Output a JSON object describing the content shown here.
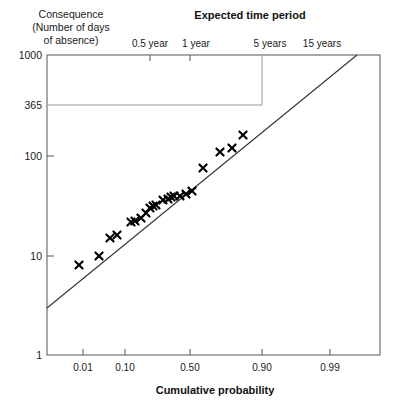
{
  "chart_data": {
    "type": "scatter",
    "title": "Expected time period",
    "xlabel": "Cumulative probability",
    "ylabel": "Consequence (Number of days of absence)",
    "ylabel_lines": [
      "Consequence",
      "(Number of days",
      "of absence)"
    ],
    "x_axis": {
      "scale": "normal-probability",
      "tick_labels": [
        "0.01",
        "0.10",
        "0.50",
        "0.90",
        "0.99"
      ],
      "tick_values": [
        0.01,
        0.1,
        0.5,
        0.9,
        0.99
      ],
      "tick_px": [
        83,
        125,
        190,
        262,
        330
      ],
      "range_px": [
        47,
        380
      ]
    },
    "y_axis": {
      "scale": "log10",
      "tick_labels": [
        "1000",
        "365",
        "100",
        "10",
        "1"
      ],
      "tick_values": [
        1000,
        365,
        100,
        10,
        1
      ],
      "tick_px": [
        55,
        105,
        156,
        256,
        355
      ],
      "ylim": [
        1,
        1000
      ],
      "range_px": [
        355,
        55
      ]
    },
    "top_axis": {
      "label": "Expected time period",
      "tick_labels": [
        "0.5 year",
        "1 year",
        "5 years",
        "15 years"
      ],
      "tick_px": [
        150,
        190,
        262,
        310
      ],
      "label_px": [
        150,
        196,
        270,
        322
      ]
    },
    "grid": false,
    "legend": null,
    "reference_lines": [
      {
        "name": "consequence-365-horizontal",
        "orientation": "horizontal",
        "value": 365,
        "from_px": [
          47,
          105
        ],
        "to_px": [
          262,
          105
        ]
      },
      {
        "name": "five-year-vertical",
        "orientation": "vertical",
        "value": "5 years",
        "from_px": [
          262,
          105
        ],
        "to_px": [
          262,
          55
        ]
      }
    ],
    "fit_line": {
      "name": "lognormal-fit-line",
      "from_px": [
        47,
        308
      ],
      "to_px": [
        357,
        55
      ]
    },
    "marker": "x",
    "points_px": [
      [
        79,
        265
      ],
      [
        99,
        256
      ],
      [
        110,
        238
      ],
      [
        117,
        235
      ],
      [
        131,
        222
      ],
      [
        135,
        221
      ],
      [
        141,
        218
      ],
      [
        146,
        213
      ],
      [
        150,
        208
      ],
      [
        153,
        206
      ],
      [
        156,
        205
      ],
      [
        163,
        200
      ],
      [
        168,
        199
      ],
      [
        171,
        197
      ],
      [
        174,
        196
      ],
      [
        180,
        196
      ],
      [
        186,
        194
      ],
      [
        192,
        191
      ],
      [
        203,
        168
      ],
      [
        220,
        152
      ],
      [
        232,
        148
      ],
      [
        243,
        135
      ]
    ],
    "points_data": [
      {
        "p": 0.02,
        "days": 9
      },
      {
        "p": 0.08,
        "days": 10.5
      },
      {
        "p": 0.12,
        "days": 14
      },
      {
        "p": 0.14,
        "days": 15
      },
      {
        "p": 0.22,
        "days": 19
      },
      {
        "p": 0.24,
        "days": 19.5
      },
      {
        "p": 0.27,
        "days": 21
      },
      {
        "p": 0.3,
        "days": 23
      },
      {
        "p": 0.33,
        "days": 25
      },
      {
        "p": 0.35,
        "days": 26
      },
      {
        "p": 0.36,
        "days": 26.5
      },
      {
        "p": 0.42,
        "days": 30
      },
      {
        "p": 0.45,
        "days": 31
      },
      {
        "p": 0.47,
        "days": 32
      },
      {
        "p": 0.48,
        "days": 32.5
      },
      {
        "p": 0.53,
        "days": 33
      },
      {
        "p": 0.57,
        "days": 34
      },
      {
        "p": 0.62,
        "days": 37
      },
      {
        "p": 0.72,
        "days": 78
      },
      {
        "p": 0.83,
        "days": 105
      },
      {
        "p": 0.88,
        "days": 115
      },
      {
        "p": 0.92,
        "days": 175
      }
    ]
  }
}
